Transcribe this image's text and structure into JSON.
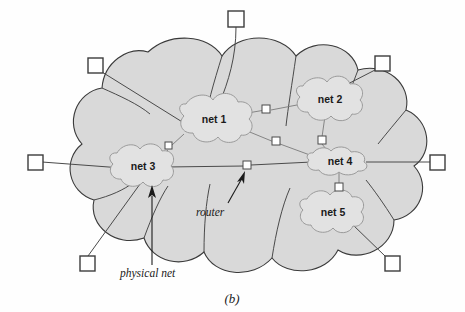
{
  "figure": {
    "caption": "(b)",
    "background_color": "#fefefe",
    "outer_cloud_fill": "#d9d9d9",
    "outer_cloud_stroke": "#3a3a3a",
    "inner_cloud_fill": "#e2e2e2",
    "inner_cloud_stroke": "#9a9a9a",
    "line_color": "#4a4a4a"
  },
  "networks": [
    {
      "id": "net1",
      "label": "net 1",
      "cx": 214,
      "cy": 120
    },
    {
      "id": "net2",
      "label": "net 2",
      "cx": 330,
      "cy": 100
    },
    {
      "id": "net3",
      "label": "net 3",
      "cx": 143,
      "cy": 167
    },
    {
      "id": "net4",
      "label": "net 4",
      "cx": 340,
      "cy": 163
    },
    {
      "id": "net5",
      "label": "net 5",
      "cx": 333,
      "cy": 213
    }
  ],
  "routers": [
    {
      "id": "router-net1-net2",
      "x": 265,
      "y": 109
    },
    {
      "id": "router-net1-net4",
      "x": 274,
      "y": 141
    },
    {
      "id": "router-net1-net3",
      "x": 169,
      "y": 145
    },
    {
      "id": "router-net2-net4",
      "x": 320,
      "y": 139
    },
    {
      "id": "router-net3-net4",
      "x": 246,
      "y": 165
    },
    {
      "id": "router-net4-net5",
      "x": 337,
      "y": 186
    }
  ],
  "hosts": [
    {
      "id": "host-top",
      "x": 228,
      "y": 11
    },
    {
      "id": "host-top-left",
      "x": 88,
      "y": 58
    },
    {
      "id": "host-top-right",
      "x": 375,
      "y": 56
    },
    {
      "id": "host-left",
      "x": 28,
      "y": 155
    },
    {
      "id": "host-right",
      "x": 430,
      "y": 155
    },
    {
      "id": "host-bottom-left",
      "x": 80,
      "y": 256
    },
    {
      "id": "host-bottom-right",
      "x": 385,
      "y": 256
    }
  ],
  "annotations": [
    {
      "id": "physical-net",
      "label": "physical net",
      "text_x": 120,
      "text_y": 275
    },
    {
      "id": "router",
      "label": "router",
      "text_x": 219,
      "text_y": 212
    }
  ]
}
